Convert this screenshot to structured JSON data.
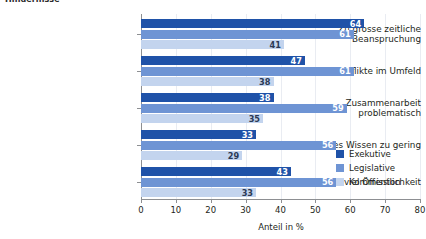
{
  "figure": {
    "partial_title": "Hindernisse",
    "axis_color": "#8d8f92",
    "grid_color": "#e9ecf2"
  },
  "chart_data": {
    "type": "bar",
    "orientation": "horizontal",
    "title": "Hindernisse",
    "xlabel": "Anteil in %",
    "ylabel": "",
    "xlim": [
      0,
      80
    ],
    "xticks": [
      0,
      10,
      20,
      30,
      40,
      50,
      60,
      70,
      80
    ],
    "grid": true,
    "legend_position": "bottom-right-inside",
    "categories": [
      "Zu grosse zeitliche Beanspruchung",
      "Konflikte im Umfeld",
      "Zusammenarbeit problematisch",
      "Fachliches Wissen zu gering",
      "Zu viel Öffentlichkeit"
    ],
    "category_lines": [
      [
        "Zu grosse zeitliche",
        "Beanspruchung"
      ],
      [
        "Konflikte im Umfeld"
      ],
      [
        "Zusammenarbeit",
        "problematisch"
      ],
      [
        "Fachliches Wissen zu gering"
      ],
      [
        "Zu viel Öffentlichkeit"
      ]
    ],
    "series": [
      {
        "name": "Exekutive",
        "color": "#1f52a8",
        "values": [
          64,
          47,
          38,
          33,
          43
        ]
      },
      {
        "name": "Legislative",
        "color": "#6e94d4",
        "values": [
          61,
          61,
          59,
          56,
          56
        ]
      },
      {
        "name": "Kommission",
        "color": "#c3d4ee",
        "values": [
          41,
          38,
          35,
          29,
          33
        ]
      }
    ]
  }
}
